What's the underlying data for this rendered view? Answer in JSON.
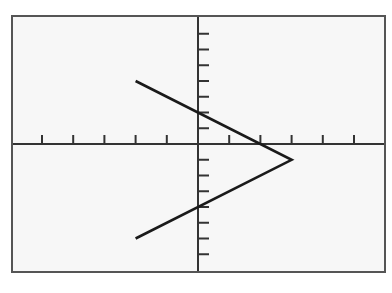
{
  "chart_data": {
    "type": "line",
    "title": "",
    "xlabel": "",
    "ylabel": "",
    "grid": false,
    "legend": null,
    "xlim": [
      -6,
      6
    ],
    "ylim": [
      -8.1,
      8.2
    ],
    "x_ticks": [
      -5,
      -4,
      -3,
      -2,
      -1,
      1,
      2,
      3,
      4,
      5
    ],
    "y_ticks": [
      -7,
      -6,
      -5,
      -4,
      -3,
      -2,
      -1,
      1,
      2,
      3,
      4,
      5,
      6,
      7
    ],
    "tick_labels_shown": false,
    "series": [
      {
        "name": "x = 3 - |y + 1|",
        "points": [
          [
            -2,
            4
          ],
          [
            3,
            -1
          ],
          [
            -2,
            -6
          ]
        ]
      }
    ]
  },
  "style": {
    "background": "#f7f7f7",
    "frame_color": "#555555",
    "axis_color": "#333333",
    "line_color": "#1a1a1a"
  },
  "layout": {
    "frame": {
      "left": 12,
      "top": 16,
      "right": 385,
      "bottom": 272
    },
    "origin_px": {
      "x": 198,
      "y": 144
    },
    "x_unit_px": 31.2,
    "y_unit_px": 15.75,
    "x_tick_len": 9,
    "y_tick_len": 11
  }
}
